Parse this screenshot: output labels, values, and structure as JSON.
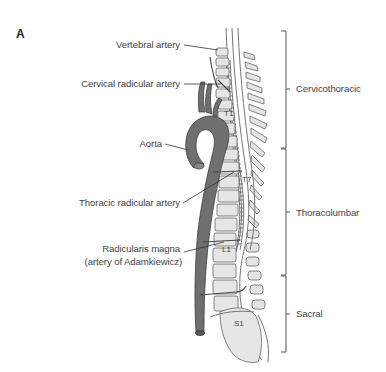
{
  "panel": {
    "letter": "A"
  },
  "labels": {
    "vertebral_artery": "Vertebral artery",
    "cervical_radicular_artery": "Cervical radicular artery",
    "aorta": "Aorta",
    "thoracic_radicular_artery": "Thoracic radicular artery",
    "radicularis_magna_line1": "Radicularis magna",
    "radicularis_magna_line2": "(artery of Adamkiewicz)"
  },
  "regions": [
    {
      "name": "Cervicothoracic"
    },
    {
      "name": "Thoracolumbar"
    },
    {
      "name": "Sacral"
    }
  ],
  "vertebra_markers": {
    "t1": "T1",
    "t7": "T7",
    "l1": "L1",
    "s1": "S1"
  },
  "colors": {
    "aorta": "#6b6b6b",
    "vertebra_fill": "#e6e6e6",
    "outline": "#555555",
    "text": "#444444"
  }
}
